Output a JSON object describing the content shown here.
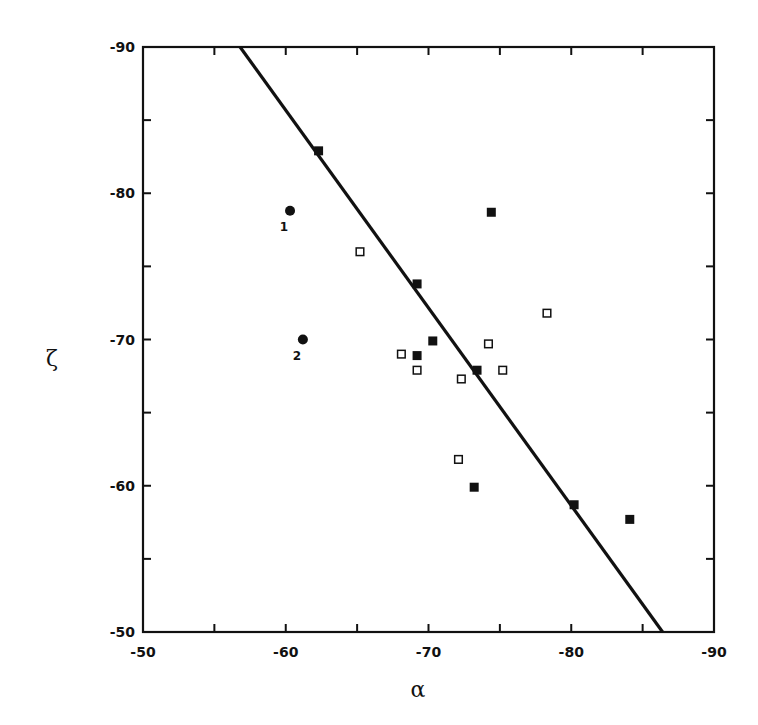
{
  "chart_data": {
    "type": "scatter",
    "title": "",
    "xlabel": "α",
    "ylabel": "ζ",
    "xlim": [
      -50,
      -90
    ],
    "ylim": [
      -50,
      -90
    ],
    "x_ticks": [
      -50,
      -60,
      -70,
      -80,
      -90
    ],
    "y_ticks": [
      -50,
      -60,
      -70,
      -80,
      -90
    ],
    "x_tick_labels": [
      "-50",
      "-60",
      "-70",
      "-80",
      "-90"
    ],
    "y_tick_labels": [
      "-50",
      "-60",
      "-70",
      "-80",
      "-90"
    ],
    "grid": false,
    "legend": null,
    "series": [
      {
        "name": "filled squares",
        "marker": "filled-square",
        "points": [
          {
            "x": -62.3,
            "y": -82.9
          },
          {
            "x": -74.4,
            "y": -78.7
          },
          {
            "x": -69.2,
            "y": -73.8
          },
          {
            "x": -70.3,
            "y": -69.9
          },
          {
            "x": -69.2,
            "y": -68.9
          },
          {
            "x": -73.4,
            "y": -67.9
          },
          {
            "x": -73.2,
            "y": -59.9
          },
          {
            "x": -80.2,
            "y": -58.7
          },
          {
            "x": -84.1,
            "y": -57.7
          }
        ]
      },
      {
        "name": "open squares",
        "marker": "open-square",
        "points": [
          {
            "x": -65.2,
            "y": -76.0
          },
          {
            "x": -78.3,
            "y": -71.8
          },
          {
            "x": -74.2,
            "y": -69.7
          },
          {
            "x": -68.1,
            "y": -69.0
          },
          {
            "x": -69.2,
            "y": -67.9
          },
          {
            "x": -75.2,
            "y": -67.9
          },
          {
            "x": -72.3,
            "y": -67.3
          },
          {
            "x": -72.1,
            "y": -61.8
          }
        ]
      },
      {
        "name": "filled circles",
        "marker": "filled-circle",
        "points": [
          {
            "x": -60.3,
            "y": -78.8,
            "label": "1"
          },
          {
            "x": -61.2,
            "y": -70.0,
            "label": "2"
          }
        ]
      }
    ],
    "line": {
      "x1": -56.8,
      "y1": -90,
      "x2": -86.4,
      "y2": -50
    }
  }
}
